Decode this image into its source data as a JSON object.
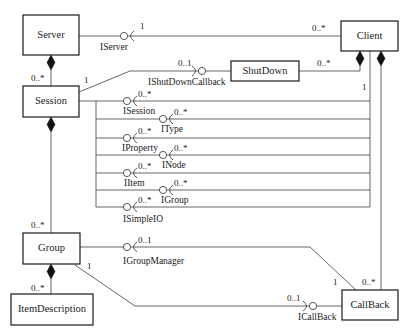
{
  "diagram": {
    "classes": {
      "server": "Server",
      "client": "Client",
      "shutdown": "ShutDown",
      "session": "Session",
      "group": "Group",
      "item_description": "ItemDescription",
      "callback": "CallBack"
    },
    "interfaces": {
      "iserver": {
        "name": "IServer",
        "mult": "1"
      },
      "ishutdowncallback": {
        "name": "IShutDownCallback",
        "mult": "0..1"
      },
      "isession": {
        "name": "ISession",
        "mult": "0..*"
      },
      "itype": {
        "name": "IType",
        "mult": "0..*"
      },
      "iproperty": {
        "name": "IProperty",
        "mult": "0..*"
      },
      "inode": {
        "name": "INode",
        "mult": "0..*"
      },
      "iitem": {
        "name": "IItem",
        "mult": "0..*"
      },
      "igroup": {
        "name": "IGroup",
        "mult": "0..*"
      },
      "isimpleio": {
        "name": "ISimpleIO",
        "mult": "0..*"
      },
      "igroupmanager": {
        "name": "IGroupManager",
        "mult": "0..1"
      },
      "icallback": {
        "name": "ICallBack",
        "mult": "0..1"
      }
    },
    "multiplicities": {
      "server_session": "0..*",
      "session_shutdown_end": "1",
      "client_iserver_end": "0..*",
      "client_shutdown_end": "0..*",
      "client_interfaces_end": "1",
      "session_group": "0..*",
      "group_itemdescription": "0..*",
      "callback_groupmanager_end": "1",
      "callback_client_end": "0..*",
      "group_callback_end": "1"
    }
  }
}
